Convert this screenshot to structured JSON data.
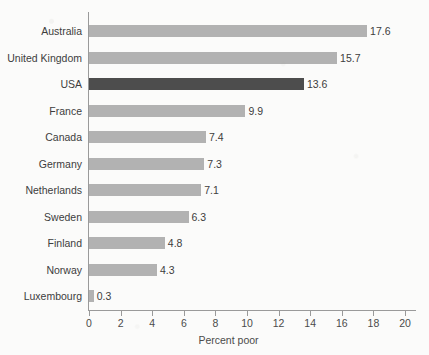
{
  "chart_data": {
    "type": "bar",
    "orientation": "horizontal",
    "title": "",
    "subtitle": "",
    "xlabel": "Percent poor",
    "ylabel": "",
    "categories": [
      "Australia",
      "United Kingdom",
      "USA",
      "France",
      "Canada",
      "Germany",
      "Netherlands",
      "Sweden",
      "Finland",
      "Norway",
      "Luxembourg"
    ],
    "values": [
      17.6,
      15.7,
      13.6,
      9.9,
      7.4,
      7.3,
      7.1,
      6.3,
      4.8,
      4.3,
      0.3
    ],
    "value_labels": [
      "17.6",
      "15.7",
      "13.6",
      "9.9",
      "7.4",
      "7.3",
      "7.1",
      "6.3",
      "4.8",
      "4.3",
      "0.3"
    ],
    "highlighted_category": "USA",
    "xlim": [
      0,
      20
    ],
    "xticks": [
      0,
      2,
      4,
      6,
      8,
      10,
      12,
      14,
      16,
      18,
      20
    ],
    "xtick_labels": [
      "0",
      "2",
      "4",
      "6",
      "8",
      "10",
      "12",
      "14",
      "16",
      "18",
      "20"
    ],
    "grid": false,
    "legend": false,
    "colors": {
      "bar": "#b2b2b2",
      "bar_highlight": "#4d4d4d",
      "axis": "#9a9a9a",
      "text": "#3d3d3d",
      "background": "#fbfbfa"
    }
  }
}
